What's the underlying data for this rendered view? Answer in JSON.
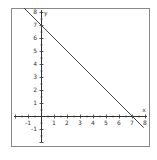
{
  "chart_data": {
    "type": "line",
    "title": "",
    "xlabel": "x",
    "ylabel": "y",
    "xlim": [
      -2,
      8.2
    ],
    "ylim": [
      -2.3,
      8.3
    ],
    "grid": false,
    "x_ticks": [
      -1,
      1,
      2,
      3,
      4,
      5,
      6,
      7,
      8
    ],
    "y_ticks": [
      -1,
      1,
      2,
      3,
      4,
      5,
      6,
      7,
      8
    ],
    "series": [
      {
        "name": "y = -x + 7",
        "equation": "y = -x + 7",
        "x": [
          -1.3,
          0,
          7,
          7.9
        ],
        "y": [
          8.3,
          7,
          0,
          -0.9
        ]
      }
    ]
  },
  "colors": {
    "line": "#444444",
    "axis": "#333333",
    "frame": "#888888",
    "background": "#ffffff"
  }
}
